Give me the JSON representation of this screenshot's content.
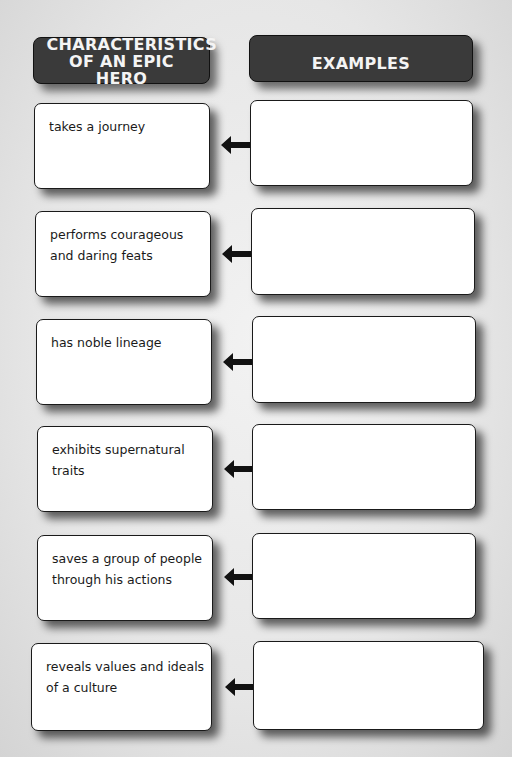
{
  "headers": {
    "characteristics": "CHARACTERISTICS OF AN EPIC HERO",
    "examples": "EXAMPLES"
  },
  "rows": [
    {
      "characteristic": "takes a journey",
      "example": ""
    },
    {
      "characteristic": "performs courageous and daring feats",
      "example": ""
    },
    {
      "characteristic": "has noble lineage",
      "example": ""
    },
    {
      "characteristic": "exhibits supernatural traits",
      "example": ""
    },
    {
      "characteristic": "saves a group of people through his actions",
      "example": ""
    },
    {
      "characteristic": "reveals values and ideals of a culture",
      "example": ""
    }
  ],
  "icons": {
    "connector": "arrow-left-icon"
  },
  "colors": {
    "header_bg": "#3a3a3a",
    "header_text": "#f4f4f4",
    "box_bg": "#ffffff",
    "page_bg": "#e6e6e6"
  }
}
